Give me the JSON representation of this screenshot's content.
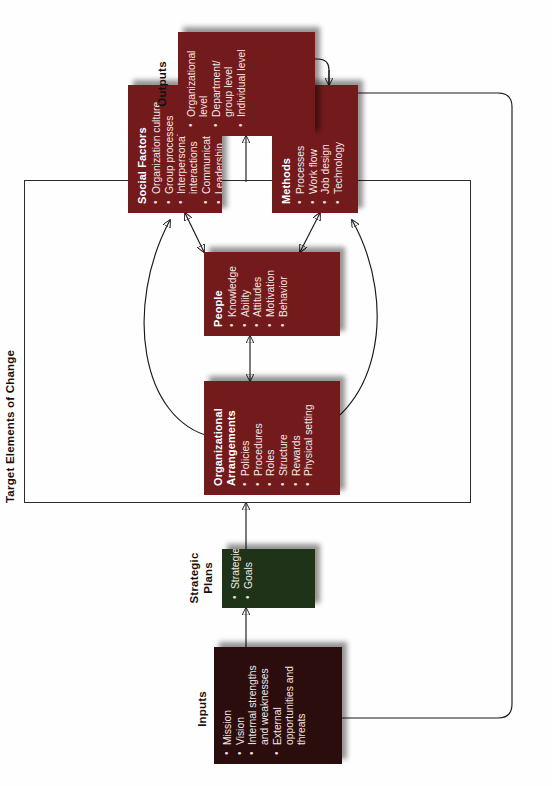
{
  "diagram": {
    "title_label": "Target Elements of Change",
    "orientation_note": "page rotated 90 degrees"
  },
  "sections": {
    "inputs": {
      "caption": "Inputs",
      "color": "#2a0d0c",
      "items": [
        "Mission",
        "Vision",
        "Internal strengths and weaknesses",
        "External opportunities and threats"
      ]
    },
    "strategic_plans": {
      "caption": "Strategic Plans",
      "caption_line1": "Strategic",
      "caption_line2": "Plans",
      "color": "#1f3318",
      "items": [
        "Strategies",
        "Goals"
      ]
    },
    "outputs": {
      "caption": "Outputs",
      "color": "#731a1c",
      "items": [
        "Organizational level",
        "Department/ group level",
        "Individual level"
      ]
    }
  },
  "target_elements": {
    "frame_label": "Target Elements of Change",
    "boxes": [
      {
        "id": "organizational-arrangements",
        "title": "Organizational Arrangements",
        "title_line1": "Organizational",
        "title_line2": "Arrangements",
        "color": "#731a1c",
        "items": [
          "Policies",
          "Procedures",
          "Roles",
          "Structure",
          "Rewards",
          "Physical setting"
        ]
      },
      {
        "id": "people",
        "title": "People",
        "color": "#731a1c",
        "items": [
          "Knowledge",
          "Ability",
          "Attitudes",
          "Motivation",
          "Behavior"
        ]
      },
      {
        "id": "social-factors",
        "title": "Social Factors",
        "color": "#731a1c",
        "items": [
          "Organization culture",
          "Group processes",
          "Interpersonal interactions",
          "Communication",
          "Leadership"
        ]
      },
      {
        "id": "methods",
        "title": "Methods",
        "color": "#731a1c",
        "items": [
          "Processes",
          "Work flow",
          "Job design",
          "Technology"
        ]
      }
    ]
  },
  "colors": {
    "maroon": "#731a1c",
    "dark_maroon": "#2a0d0c",
    "dark_green": "#1f3318",
    "line": "#1a1a1a",
    "text_on_box": "#f3e6e2"
  }
}
